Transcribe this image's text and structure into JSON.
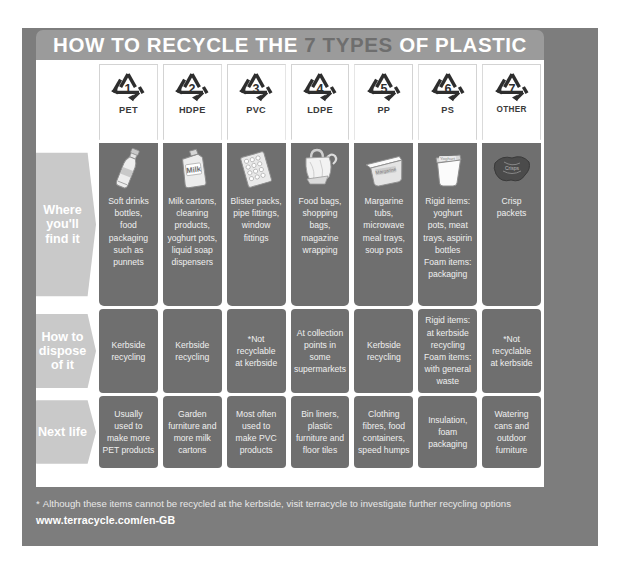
{
  "poster": {
    "title_main_1": "HOW TO RECYCLE THE ",
    "title_highlight": "7 TYPES",
    "title_main_2": " OF PLASTIC",
    "title_full": "HOW TO RECYCLE THE 7 TYPES OF PLASTIC",
    "bg_color": "#7d7d7d",
    "title_bar_color": "#9b9b9b",
    "panel_color": "#ffffff",
    "cell_color": "#6f6f6f",
    "row_label_color": "#c9c9c9",
    "text_color": "#f0f0f0"
  },
  "columns": [
    {
      "number": "1",
      "abbr": "PET",
      "icon": "recycling-triangle-1"
    },
    {
      "number": "2",
      "abbr": "HDPE",
      "icon": "recycling-triangle-2"
    },
    {
      "number": "3",
      "abbr": "PVC",
      "icon": "recycling-triangle-3"
    },
    {
      "number": "4",
      "abbr": "LDPE",
      "icon": "recycling-triangle-4"
    },
    {
      "number": "5",
      "abbr": "PP",
      "icon": "recycling-triangle-5"
    },
    {
      "number": "6",
      "abbr": "PS",
      "icon": "recycling-triangle-6"
    },
    {
      "number": "7",
      "abbr": "OTHER",
      "icon": "recycling-triangle-7"
    }
  ],
  "rows": [
    {
      "label": "Where\nyou'll\nfind it",
      "cells": [
        "Soft drinks\nbottles,\nfood\npackaging\nsuch as\npunnets",
        "Milk cartons,\ncleaning\nproducts,\nyoghurt pots,\nliquid soap\ndispensers",
        "Blister packs,\npipe fittings,\nwindow\nfittings",
        "Food bags,\nshopping\nbags,\nmagazine\nwrapping",
        "Margarine\ntubs,\nmicrowave\nmeal trays,\nsoup pots",
        "Rigid items:\nyoghurt\npots, meat\ntrays, aspirin\nbottles\nFoam items:\npackaging",
        "Crisp\npackets"
      ],
      "thumbs": [
        "plastic-bottle-icon",
        "milk-jug-icon",
        "blister-pack-icon",
        "shopping-bag-icon",
        "margarine-tub-icon",
        "yoghurt-pot-icon",
        "crisp-packet-icon"
      ]
    },
    {
      "label": "How\nto\ndispose\nof it",
      "cells": [
        "Kerbside\nrecycling",
        "Kerbside\nrecycling",
        "*Not\nrecyclable\nat kerbside",
        "At collection\npoints in\nsome\nsupermarkets",
        "Kerbside\nrecycling",
        "Rigid items:\nat kerbside\nrecycling\nFoam items:\nwith general\nwaste",
        "*Not\nrecyclable\nat kerbside"
      ]
    },
    {
      "label": "Next\nlife",
      "cells": [
        "Usually\nused to\nmake more\nPET products",
        "Garden\nfurniture and\nmore milk\ncartons",
        "Most often\nused to\nmake PVC\nproducts",
        "Bin liners,\nplastic\nfurniture and\nfloor tiles",
        "Clothing\nfibres, food\ncontainers,\nspeed humps",
        "Insulation,\nfoam\npackaging",
        "Watering\ncans and\noutdoor\nfurniture"
      ]
    }
  ],
  "footer": {
    "asterisk": "*",
    "note": "Although these items cannot be recycled at the kerbside, visit terracycle to investigate further recycling options",
    "url": "www.terracycle.com/en-GB"
  }
}
